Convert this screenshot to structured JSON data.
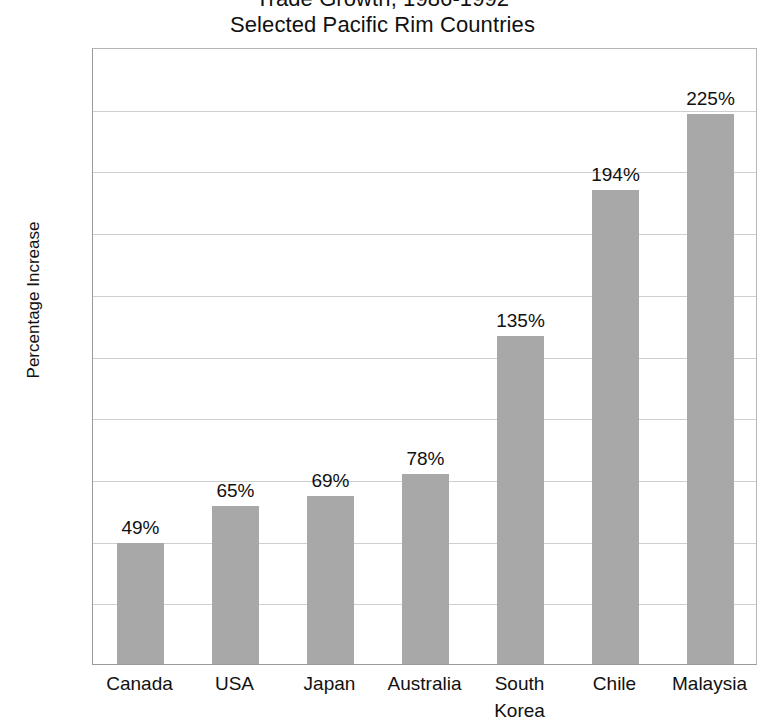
{
  "chart_data": {
    "type": "bar",
    "title": "Trade Growth, 1986-1992",
    "subtitle": "Selected Pacific Rim Countries",
    "title_lines": [
      "Trade Growth, 1986-1992",
      "Selected Pacific Rim Countries"
    ],
    "xlabel": "",
    "ylabel": "Percentage Increase",
    "ylim": [
      0,
      250
    ],
    "ytick_step": 25,
    "ytick_labels": [
      "%250",
      "225",
      "200",
      "175",
      "150",
      "125",
      "100",
      "75",
      "50",
      "25",
      "0"
    ],
    "ytick_values": [
      250,
      225,
      200,
      175,
      150,
      125,
      100,
      75,
      50,
      25,
      0
    ],
    "grid": true,
    "legend": false,
    "categories": [
      "Canada",
      "USA",
      "Japan",
      "Australia",
      "South Korea",
      "Chile",
      "Malaysia"
    ],
    "category_lines": [
      [
        "Canada"
      ],
      [
        "USA"
      ],
      [
        "Japan"
      ],
      [
        "Australia"
      ],
      [
        "South",
        "Korea"
      ],
      [
        "Chile"
      ],
      [
        "Malaysia"
      ]
    ],
    "values": [
      49,
      65,
      69,
      78,
      135,
      194,
      225
    ],
    "bar_heights": [
      49,
      64,
      68,
      77,
      133,
      192,
      223
    ],
    "data_labels": [
      "49%",
      "65%",
      "69%",
      "78%",
      "135%",
      "194%",
      "225%"
    ],
    "colors": {
      "bar": "#a8a8a8",
      "grid": "#cfcfcf",
      "axis": "#9a9a9a",
      "text": "#111111",
      "background": "#ffffff"
    }
  }
}
